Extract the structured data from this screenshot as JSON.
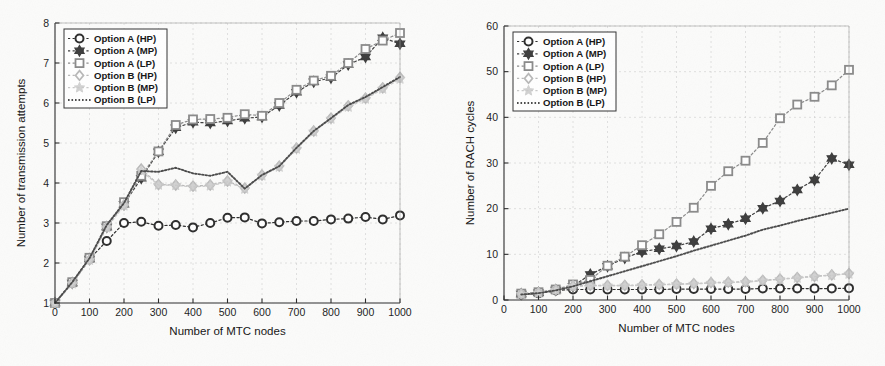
{
  "figure": {
    "background_color": "#fbfbfa",
    "panel_count": 2
  },
  "series_names": [
    "Option A (HP)",
    "Option A (MP)",
    "Option A (LP)",
    "Option B (HP)",
    "Option B (MP)",
    "Option B (LP)"
  ],
  "series_colors": [
    "#2c2c2c",
    "#3d3d3d",
    "#8a8a8a",
    "#b9b9b9",
    "#c9c9c9",
    "#4a4a4a"
  ],
  "series_markers": [
    "circle",
    "hexagram",
    "square",
    "diamond",
    "pentagram",
    "none"
  ],
  "chart_data": [
    {
      "id": "left",
      "type": "line",
      "title": "",
      "xlabel": "Number of MTC nodes",
      "ylabel": "Number of transmission attempts",
      "xlim": [
        0,
        1000
      ],
      "ylim": [
        1,
        8
      ],
      "xticks": [
        0,
        100,
        200,
        300,
        400,
        500,
        600,
        700,
        800,
        900,
        1000
      ],
      "yticks": [
        1,
        2,
        3,
        4,
        5,
        6,
        7,
        8
      ],
      "grid": true,
      "legend_position": "upper left",
      "x": [
        0,
        50,
        100,
        150,
        200,
        250,
        300,
        350,
        400,
        450,
        500,
        550,
        600,
        650,
        700,
        750,
        800,
        850,
        900,
        950,
        1000
      ],
      "series": [
        {
          "name": "Option A (HP)",
          "marker": "circle",
          "color": "#2c2c2c",
          "values": [
            1.0,
            1.5,
            2.1,
            2.55,
            3.0,
            3.03,
            2.93,
            2.95,
            2.89,
            3.0,
            3.13,
            3.14,
            2.99,
            3.02,
            3.05,
            3.05,
            3.09,
            3.11,
            3.15,
            3.09,
            3.19
          ]
        },
        {
          "name": "Option A (MP)",
          "marker": "hexagram",
          "color": "#3d3d3d",
          "values": [
            1.0,
            1.5,
            2.1,
            2.9,
            3.47,
            4.12,
            4.78,
            5.38,
            5.52,
            5.5,
            5.55,
            5.62,
            5.65,
            5.94,
            6.27,
            6.53,
            6.63,
            6.96,
            7.15,
            7.63,
            7.48
          ]
        },
        {
          "name": "Option A (LP)",
          "marker": "square",
          "color": "#8a8a8a",
          "values": [
            1.0,
            1.52,
            2.13,
            2.92,
            3.52,
            4.18,
            4.79,
            5.45,
            5.59,
            5.6,
            5.63,
            5.72,
            5.68,
            6.0,
            6.33,
            6.56,
            6.68,
            7.0,
            7.35,
            7.56,
            7.75
          ]
        },
        {
          "name": "Option B (HP)",
          "marker": "diamond",
          "color": "#b9b9b9",
          "values": [
            1.0,
            1.5,
            2.08,
            2.9,
            3.45,
            4.35,
            3.96,
            3.95,
            3.92,
            3.95,
            4.05,
            3.87,
            4.2,
            4.42,
            4.87,
            5.3,
            5.62,
            5.93,
            6.12,
            6.38,
            6.64
          ]
        },
        {
          "name": "Option B (MP)",
          "marker": "pentagram",
          "color": "#c9c9c9",
          "values": [
            1.0,
            1.48,
            2.07,
            2.88,
            3.43,
            4.3,
            3.95,
            3.94,
            3.9,
            3.93,
            4.03,
            3.85,
            4.18,
            4.4,
            4.85,
            5.28,
            5.6,
            5.9,
            6.1,
            6.35,
            6.6
          ]
        },
        {
          "name": "Option B (LP)",
          "marker": "none",
          "color": "#4a4a4a",
          "values": [
            1.0,
            1.52,
            2.12,
            2.95,
            3.5,
            4.3,
            4.28,
            4.38,
            4.24,
            4.18,
            4.28,
            3.86,
            4.2,
            4.42,
            4.88,
            5.3,
            5.62,
            5.95,
            6.15,
            6.4,
            6.65
          ]
        }
      ]
    },
    {
      "id": "right",
      "type": "line",
      "title": "",
      "xlabel": "Number of MTC nodes",
      "ylabel": "Number of RACH cycles",
      "xlim": [
        0,
        1000
      ],
      "ylim": [
        0,
        60
      ],
      "xticks": [
        0,
        100,
        200,
        300,
        400,
        500,
        600,
        700,
        800,
        900,
        1000
      ],
      "yticks": [
        0,
        10,
        20,
        30,
        40,
        50,
        60
      ],
      "grid": true,
      "legend_position": "upper left",
      "x": [
        50,
        100,
        150,
        200,
        250,
        300,
        350,
        400,
        450,
        500,
        550,
        600,
        650,
        700,
        750,
        800,
        850,
        900,
        950,
        1000
      ],
      "series": [
        {
          "name": "Option A (HP)",
          "marker": "circle",
          "color": "#2c2c2c",
          "values": [
            1.2,
            1.5,
            2.1,
            2.3,
            2.3,
            2.3,
            2.3,
            2.3,
            2.3,
            2.4,
            2.4,
            2.4,
            2.4,
            2.4,
            2.5,
            2.5,
            2.5,
            2.5,
            2.5,
            2.6
          ]
        },
        {
          "name": "Option A (MP)",
          "marker": "hexagram",
          "color": "#3d3d3d",
          "values": [
            1.3,
            1.6,
            2.2,
            3.0,
            5.6,
            7.4,
            9.2,
            10.6,
            11.2,
            11.8,
            12.8,
            15.6,
            16.6,
            17.8,
            20.1,
            21.7,
            24.1,
            26.3,
            31.0,
            29.6
          ]
        },
        {
          "name": "Option A (LP)",
          "marker": "square",
          "color": "#8a8a8a",
          "values": [
            1.4,
            1.7,
            2.3,
            3.4,
            4.4,
            7.5,
            9.5,
            12.0,
            14.4,
            17.1,
            20.2,
            25.0,
            28.2,
            30.5,
            34.4,
            39.8,
            42.8,
            44.5,
            47.0,
            50.4
          ]
        },
        {
          "name": "Option B (HP)",
          "marker": "diamond",
          "color": "#b9b9b9",
          "values": [
            1.3,
            1.6,
            2.2,
            3.1,
            3.2,
            3.2,
            3.2,
            3.3,
            3.4,
            3.5,
            3.6,
            3.8,
            3.9,
            4.0,
            4.3,
            4.6,
            4.9,
            5.2,
            5.5,
            5.8
          ]
        },
        {
          "name": "Option B (MP)",
          "marker": "pentagram",
          "color": "#c9c9c9",
          "values": [
            1.25,
            1.55,
            2.15,
            3.0,
            3.1,
            3.1,
            3.1,
            3.2,
            3.3,
            3.4,
            3.5,
            3.7,
            3.8,
            3.9,
            4.2,
            4.5,
            4.8,
            5.1,
            5.4,
            5.7
          ]
        },
        {
          "name": "Option B (LP)",
          "marker": "none",
          "color": "#4a4a4a",
          "values": [
            1.2,
            1.5,
            2.1,
            3.0,
            4.1,
            5.2,
            6.3,
            7.4,
            8.5,
            9.6,
            10.8,
            11.9,
            13.0,
            14.1,
            15.4,
            16.3,
            17.3,
            18.2,
            19.1,
            20.0
          ]
        }
      ]
    }
  ]
}
